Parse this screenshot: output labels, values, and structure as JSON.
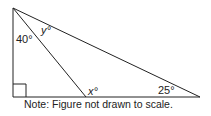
{
  "figure": {
    "labels": {
      "top_left_angle": "40°",
      "inner_angle": "y°",
      "foot_angle": "x°",
      "right_angle": "25°"
    },
    "note": "Note: Figure not drawn to scale."
  }
}
